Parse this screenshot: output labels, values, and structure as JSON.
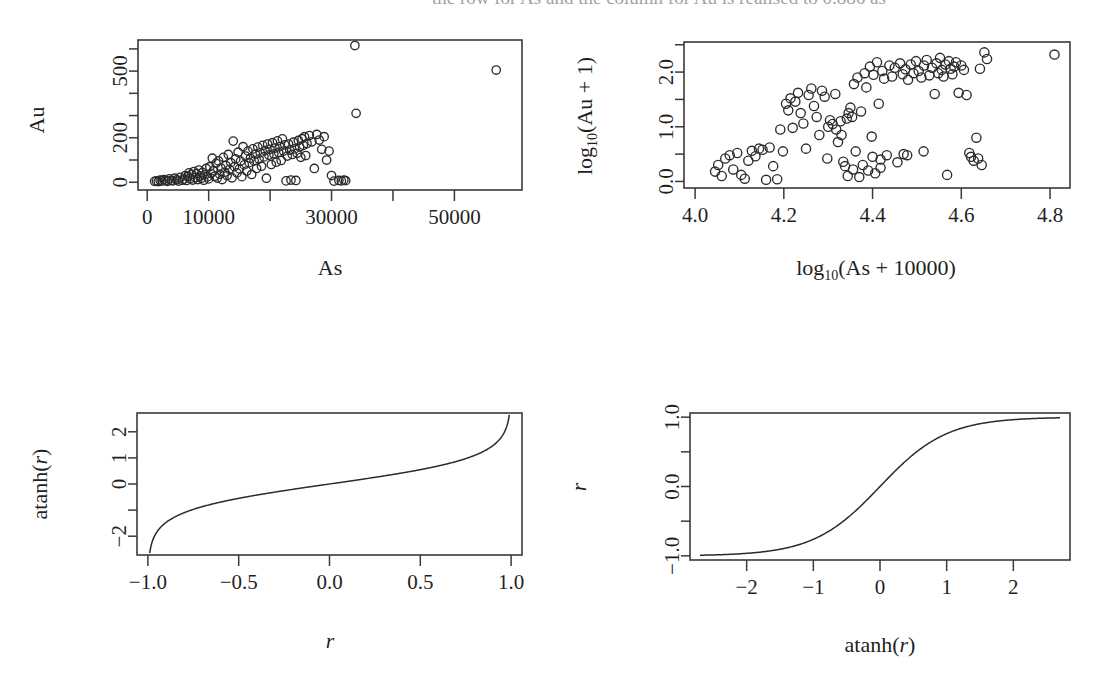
{
  "figure": {
    "clipped_caption_fragment": "the row for As and the column for Au is realised to 0.886 as",
    "background": "#ffffff",
    "ink": "#2b2b2b"
  },
  "chart_data": [
    {
      "id": "panel-au-vs-as",
      "type": "scatter",
      "title": "",
      "xlabel": "As",
      "ylabel": "Au",
      "xlim": [
        -1500,
        61000
      ],
      "ylim": [
        -35,
        640
      ],
      "xticks": [
        0,
        10000,
        20000,
        30000,
        40000,
        50000
      ],
      "xticklabels": [
        "0",
        "10000",
        "",
        "30000",
        "",
        "50000"
      ],
      "yticks": [
        0,
        100,
        200,
        300,
        400,
        500,
        600
      ],
      "yticklabels": [
        "0",
        "",
        "200",
        "",
        "",
        "500",
        ""
      ],
      "grid": false,
      "legend": "none",
      "marker": "open-circle",
      "points": [
        [
          1200,
          4
        ],
        [
          1500,
          6
        ],
        [
          1800,
          3
        ],
        [
          2100,
          9
        ],
        [
          2400,
          5
        ],
        [
          2700,
          12
        ],
        [
          3000,
          7
        ],
        [
          3300,
          4
        ],
        [
          3600,
          15
        ],
        [
          3900,
          8
        ],
        [
          4200,
          6
        ],
        [
          4500,
          18
        ],
        [
          4800,
          11
        ],
        [
          5100,
          5
        ],
        [
          5400,
          22
        ],
        [
          5700,
          9
        ],
        [
          6000,
          14
        ],
        [
          6200,
          30
        ],
        [
          6400,
          8
        ],
        [
          6600,
          26
        ],
        [
          6800,
          42
        ],
        [
          7000,
          16
        ],
        [
          7200,
          35
        ],
        [
          7400,
          10
        ],
        [
          7600,
          48
        ],
        [
          7800,
          21
        ],
        [
          8000,
          38
        ],
        [
          8200,
          12
        ],
        [
          8400,
          55
        ],
        [
          8600,
          28
        ],
        [
          8800,
          18
        ],
        [
          9000,
          44
        ],
        [
          9200,
          9
        ],
        [
          9400,
          33
        ],
        [
          9600,
          62
        ],
        [
          9800,
          24
        ],
        [
          10000,
          15
        ],
        [
          10200,
          70
        ],
        [
          10400,
          40
        ],
        [
          10600,
          108
        ],
        [
          10800,
          52
        ],
        [
          11000,
          27
        ],
        [
          11200,
          85
        ],
        [
          11400,
          19
        ],
        [
          11600,
          96
        ],
        [
          11800,
          36
        ],
        [
          12000,
          64
        ],
        [
          12200,
          12
        ],
        [
          12400,
          112
        ],
        [
          12600,
          45
        ],
        [
          12800,
          75
        ],
        [
          13000,
          30
        ],
        [
          13200,
          125
        ],
        [
          13400,
          58
        ],
        [
          13600,
          88
        ],
        [
          13800,
          20
        ],
        [
          14000,
          185
        ],
        [
          14200,
          70
        ],
        [
          14400,
          105
        ],
        [
          14600,
          42
        ],
        [
          14800,
          135
        ],
        [
          15000,
          60
        ],
        [
          15200,
          95
        ],
        [
          15400,
          25
        ],
        [
          15600,
          160
        ],
        [
          15800,
          78
        ],
        [
          16000,
          118
        ],
        [
          16200,
          50
        ],
        [
          16400,
          140
        ],
        [
          16600,
          88
        ],
        [
          16800,
          108
        ],
        [
          17000,
          35
        ],
        [
          17200,
          150
        ],
        [
          17400,
          96
        ],
        [
          17600,
          126
        ],
        [
          17800,
          62
        ],
        [
          18000,
          158
        ],
        [
          18200,
          104
        ],
        [
          18400,
          132
        ],
        [
          18600,
          72
        ],
        [
          18800,
          166
        ],
        [
          19000,
          114
        ],
        [
          19200,
          142
        ],
        [
          19400,
          18
        ],
        [
          19600,
          172
        ],
        [
          19800,
          122
        ],
        [
          20000,
          148
        ],
        [
          20200,
          80
        ],
        [
          20400,
          178
        ],
        [
          20600,
          128
        ],
        [
          20800,
          154
        ],
        [
          21000,
          90
        ],
        [
          21200,
          186
        ],
        [
          21400,
          134
        ],
        [
          21600,
          160
        ],
        [
          21800,
          98
        ],
        [
          22000,
          195
        ],
        [
          22200,
          140
        ],
        [
          22400,
          168
        ],
        [
          22600,
          6
        ],
        [
          22800,
          118
        ],
        [
          23000,
          172
        ],
        [
          23200,
          145
        ],
        [
          23400,
          10
        ],
        [
          23600,
          125
        ],
        [
          23800,
          180
        ],
        [
          24000,
          150
        ],
        [
          24200,
          8
        ],
        [
          24400,
          130
        ],
        [
          24600,
          188
        ],
        [
          24800,
          158
        ],
        [
          25000,
          112
        ],
        [
          25200,
          196
        ],
        [
          25400,
          166
        ],
        [
          25600,
          205
        ],
        [
          25800,
          120
        ],
        [
          26000,
          174
        ],
        [
          26400,
          210
        ],
        [
          26800,
          182
        ],
        [
          27200,
          62
        ],
        [
          27600,
          215
        ],
        [
          28000,
          190
        ],
        [
          28400,
          148
        ],
        [
          28800,
          205
        ],
        [
          29200,
          100
        ],
        [
          29600,
          140
        ],
        [
          30000,
          30
        ],
        [
          30400,
          5
        ],
        [
          31200,
          8
        ],
        [
          31600,
          6
        ],
        [
          32000,
          10
        ],
        [
          32300,
          7
        ],
        [
          33800,
          615
        ],
        [
          34000,
          310
        ],
        [
          56800,
          505
        ]
      ]
    },
    {
      "id": "panel-logau-vs-logas",
      "type": "scatter",
      "title": "",
      "xlabel": "log10(As + 10000)",
      "ylabel": "log10(Au + 1)",
      "xlim": [
        3.975,
        4.845
      ],
      "ylim": [
        -0.12,
        2.55
      ],
      "xticks": [
        4.0,
        4.2,
        4.4,
        4.6,
        4.8
      ],
      "xticklabels": [
        "4.0",
        "4.2",
        "4.4",
        "4.6",
        "4.8"
      ],
      "yticks": [
        0.0,
        0.5,
        1.0,
        1.5,
        2.0,
        2.5
      ],
      "yticklabels": [
        "0.0",
        "",
        "1.0",
        "",
        "2.0",
        ""
      ],
      "grid": false,
      "legend": "none",
      "marker": "open-circle",
      "points": [
        [
          4.045,
          0.18
        ],
        [
          4.052,
          0.3
        ],
        [
          4.06,
          0.1
        ],
        [
          4.068,
          0.42
        ],
        [
          4.078,
          0.48
        ],
        [
          4.086,
          0.22
        ],
        [
          4.095,
          0.52
        ],
        [
          4.104,
          0.12
        ],
        [
          4.112,
          0.05
        ],
        [
          4.12,
          0.38
        ],
        [
          4.128,
          0.56
        ],
        [
          4.136,
          0.46
        ],
        [
          4.144,
          0.6
        ],
        [
          4.152,
          0.58
        ],
        [
          4.16,
          0.03
        ],
        [
          4.168,
          0.62
        ],
        [
          4.176,
          0.28
        ],
        [
          4.185,
          0.04
        ],
        [
          4.192,
          0.95
        ],
        [
          4.198,
          0.55
        ],
        [
          4.205,
          1.42
        ],
        [
          4.21,
          1.3
        ],
        [
          4.215,
          1.52
        ],
        [
          4.22,
          0.98
        ],
        [
          4.226,
          1.46
        ],
        [
          4.232,
          1.62
        ],
        [
          4.238,
          1.25
        ],
        [
          4.244,
          1.06
        ],
        [
          4.25,
          0.6
        ],
        [
          4.256,
          1.58
        ],
        [
          4.262,
          1.7
        ],
        [
          4.268,
          1.38
        ],
        [
          4.274,
          1.18
        ],
        [
          4.28,
          0.85
        ],
        [
          4.286,
          1.66
        ],
        [
          4.292,
          1.55
        ],
        [
          4.298,
          0.42
        ],
        [
          4.304,
          1.12
        ],
        [
          4.31,
          1.05
        ],
        [
          4.316,
          1.6
        ],
        [
          4.322,
          0.72
        ],
        [
          4.328,
          1.1
        ],
        [
          4.334,
          0.36
        ],
        [
          4.338,
          0.28
        ],
        [
          4.342,
          1.15
        ],
        [
          4.346,
          1.25
        ],
        [
          4.35,
          1.35
        ],
        [
          4.354,
          1.18
        ],
        [
          4.358,
          1.78
        ],
        [
          4.362,
          0.55
        ],
        [
          4.366,
          1.9
        ],
        [
          4.37,
          0.08
        ],
        [
          4.374,
          1.28
        ],
        [
          4.378,
          0.3
        ],
        [
          4.382,
          1.98
        ],
        [
          4.386,
          1.72
        ],
        [
          4.39,
          0.2
        ],
        [
          4.394,
          2.1
        ],
        [
          4.398,
          0.82
        ],
        [
          4.402,
          1.95
        ],
        [
          4.406,
          0.15
        ],
        [
          4.41,
          2.18
        ],
        [
          4.414,
          1.42
        ],
        [
          4.418,
          0.4
        ],
        [
          4.422,
          2.02
        ],
        [
          4.426,
          1.88
        ],
        [
          4.432,
          0.48
        ],
        [
          4.438,
          2.12
        ],
        [
          4.444,
          1.92
        ],
        [
          4.45,
          2.08
        ],
        [
          4.456,
          0.35
        ],
        [
          4.462,
          2.16
        ],
        [
          4.468,
          1.96
        ],
        [
          4.474,
          2.05
        ],
        [
          4.48,
          1.86
        ],
        [
          4.486,
          2.14
        ],
        [
          4.492,
          1.98
        ],
        [
          4.498,
          2.2
        ],
        [
          4.504,
          2.02
        ],
        [
          4.51,
          1.9
        ],
        [
          4.516,
          2.12
        ],
        [
          4.522,
          2.22
        ],
        [
          4.528,
          1.94
        ],
        [
          4.534,
          2.08
        ],
        [
          4.54,
          1.6
        ],
        [
          4.544,
          2.16
        ],
        [
          4.548,
          1.98
        ],
        [
          4.552,
          2.26
        ],
        [
          4.556,
          2.04
        ],
        [
          4.56,
          1.92
        ],
        [
          4.564,
          2.14
        ],
        [
          4.568,
          0.12
        ],
        [
          4.572,
          2.2
        ],
        [
          4.576,
          2.06
        ],
        [
          4.58,
          1.96
        ],
        [
          4.584,
          2.1
        ],
        [
          4.588,
          2.18
        ],
        [
          4.594,
          1.62
        ],
        [
          4.6,
          2.12
        ],
        [
          4.606,
          2.04
        ],
        [
          4.612,
          1.58
        ],
        [
          4.618,
          0.52
        ],
        [
          4.622,
          0.45
        ],
        [
          4.628,
          0.38
        ],
        [
          4.634,
          0.8
        ],
        [
          4.638,
          0.42
        ],
        [
          4.642,
          2.06
        ],
        [
          4.646,
          0.3
        ],
        [
          4.652,
          2.36
        ],
        [
          4.658,
          2.24
        ],
        [
          4.81,
          2.32
        ],
        [
          4.47,
          0.5
        ],
        [
          4.478,
          0.48
        ],
        [
          4.515,
          0.55
        ],
        [
          4.4,
          0.45
        ],
        [
          4.418,
          0.25
        ],
        [
          4.344,
          0.1
        ],
        [
          4.356,
          0.22
        ],
        [
          4.33,
          0.85
        ],
        [
          4.318,
          0.95
        ],
        [
          4.3,
          1.0
        ]
      ]
    },
    {
      "id": "panel-atanh-of-r",
      "type": "line",
      "title": "",
      "xlabel": "r",
      "ylabel": "atanh(r)",
      "xlim": [
        -1.06,
        1.06
      ],
      "ylim": [
        -2.72,
        2.72
      ],
      "xticks": [
        -1.0,
        -0.5,
        0.0,
        0.5,
        1.0
      ],
      "xticklabels": [
        "-1.0",
        "-0.5",
        "0.0",
        "0.5",
        "1.0"
      ],
      "yticks": [
        -2,
        -1,
        0,
        1,
        2
      ],
      "yticklabels": [
        "-2",
        "",
        "0",
        "1",
        "2"
      ],
      "grid": false,
      "legend": "none",
      "function": "y = atanh(x)",
      "x_domain": [
        -0.99,
        0.99
      ]
    },
    {
      "id": "panel-tanh-of-atanh",
      "type": "line",
      "title": "",
      "xlabel": "atanh(r)",
      "ylabel": "r",
      "xlim": [
        -2.85,
        2.85
      ],
      "ylim": [
        -1.06,
        1.06
      ],
      "xticks": [
        -2,
        -1,
        0,
        1,
        2
      ],
      "xticklabels": [
        "-2",
        "-1",
        "0",
        "1",
        "2"
      ],
      "yticks": [
        -1.0,
        -0.5,
        0.0,
        0.5,
        1.0
      ],
      "yticklabels": [
        "-1.0",
        "",
        "0.0",
        "",
        "1.0"
      ],
      "grid": false,
      "legend": "none",
      "function": "y = tanh(x)",
      "x_domain": [
        -2.7,
        2.7
      ]
    }
  ],
  "labels": {
    "p1_y": "Au",
    "p1_x": "As",
    "p1_yticks": [
      "0",
      "200",
      "500"
    ],
    "p1_xticks": [
      "0",
      "10000",
      "30000",
      "50000"
    ],
    "p2_y_pre": "log",
    "p2_y_sub": "10",
    "p2_y_post": "(Au + 1)",
    "p2_x_pre": "log",
    "p2_x_sub": "10",
    "p2_x_post": "(As + 10000)",
    "p2_yticks": [
      "0.0",
      "1.0",
      "2.0"
    ],
    "p2_xticks": [
      "4.0",
      "4.2",
      "4.4",
      "4.6",
      "4.8"
    ],
    "p3_y": "atanh(r)",
    "p3_x": "r",
    "p3_yticks": [
      "-2",
      "0",
      "1",
      "2"
    ],
    "p3_xticks": [
      "-1.0",
      "-0.5",
      "0.0",
      "0.5",
      "1.0"
    ],
    "p4_y": "r",
    "p4_x_pre": "atanh(",
    "p4_x_var": "r",
    "p4_x_post": ")",
    "p4_yticks": [
      "-1.0",
      "0.0",
      "1.0"
    ],
    "p4_xticks": [
      "-2",
      "-1",
      "0",
      "1",
      "2"
    ]
  }
}
